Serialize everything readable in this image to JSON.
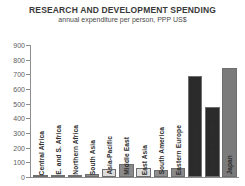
{
  "chart_data": {
    "type": "bar",
    "title": "RESEARCH AND DEVELOPMENT SPENDING",
    "subtitle": "annual expenditure per person, PPP US$",
    "xlabel": "",
    "ylabel": "",
    "ylim": [
      0,
      900
    ],
    "ytick_step": 100,
    "yticks": [
      "900",
      "800",
      "700",
      "600",
      "500",
      "400",
      "300",
      "200",
      "100",
      "0"
    ],
    "grid": false,
    "legend": "none",
    "categories": [
      "Central Africa",
      "E. and S. Africa",
      "Northern Africa",
      "South Asia",
      "Asia-Pacific",
      "Middle East",
      "East Asia",
      "South America",
      "Eastern Europe",
      "North America",
      "Western Europe",
      "Japan"
    ],
    "values": [
      5,
      10,
      14,
      20,
      55,
      90,
      60,
      45,
      62,
      690,
      480,
      740
    ],
    "bar_colors": [
      "#c9c9c9",
      "#8f8f8f",
      "#c9c9c9",
      "#8f8f8f",
      "#dcdcdc",
      "#8a8a8a",
      "#dcdcdc",
      "#8f8f8f",
      "#8a8a8a",
      "#2b2b2b",
      "#2b2b2b",
      "#7b7b7b"
    ]
  },
  "colors": {
    "axis": "#8d8d8d",
    "title_text": "#3a3a3a",
    "tick_text": "#5d5d5d",
    "label_text": "#2e2e2e",
    "background": "#ffffff"
  }
}
